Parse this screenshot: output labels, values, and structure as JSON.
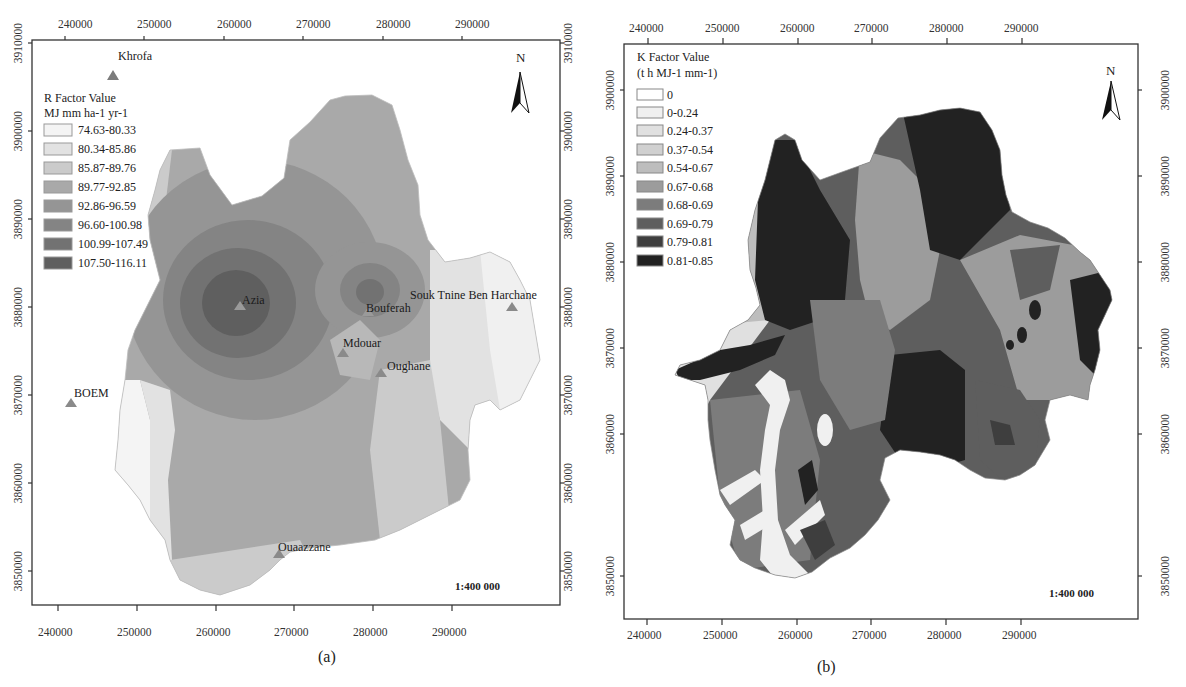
{
  "figure": {
    "panels": [
      {
        "id": "a",
        "caption": "(a)",
        "x_ticks": [
          "240000",
          "250000",
          "260000",
          "270000",
          "280000",
          "290000"
        ],
        "y_ticks": [
          "3910000",
          "3900000",
          "3890000",
          "3880000",
          "3870000",
          "3860000",
          "3850000"
        ],
        "legend": {
          "title_line1": "R Factor Value",
          "title_line2": "MJ mm ha-1 yr-1",
          "items": [
            {
              "label": "74.63-80.33",
              "color": "#f4f4f4"
            },
            {
              "label": "80.34-85.86",
              "color": "#e2e2e2"
            },
            {
              "label": "85.87-89.76",
              "color": "#cbcbcb"
            },
            {
              "label": "89.77-92.85",
              "color": "#a9a9a9"
            },
            {
              "label": "92.86-96.59",
              "color": "#959595"
            },
            {
              "label": "96.60-100.98",
              "color": "#848484"
            },
            {
              "label": "100.99-107.49",
              "color": "#727272"
            },
            {
              "label": "107.50-116.11",
              "color": "#5f5f5f"
            }
          ]
        },
        "stations": [
          {
            "name": "Khrofa"
          },
          {
            "name": "Azia"
          },
          {
            "name": "Bouferah"
          },
          {
            "name": "Souk Tnine Ben Harchane"
          },
          {
            "name": "Mdouar"
          },
          {
            "name": "Oughane"
          },
          {
            "name": "BOEM"
          },
          {
            "name": "Ouaazzane"
          }
        ],
        "north_label": "N",
        "scale": "1:400 000"
      },
      {
        "id": "b",
        "caption": "(b)",
        "x_ticks": [
          "240000",
          "250000",
          "260000",
          "270000",
          "280000",
          "290000"
        ],
        "y_ticks": [
          "3900000",
          "3890000",
          "3880000",
          "3870000",
          "3860000",
          "3850000"
        ],
        "legend": {
          "title_line1": "K Factor Value",
          "title_line2": "(t h MJ-1 mm-1)",
          "items": [
            {
              "label": "0",
              "color": "#ffffff"
            },
            {
              "label": "0-0.24",
              "color": "#f0f0f0"
            },
            {
              "label": "0.24-0.37",
              "color": "#e0e0e0"
            },
            {
              "label": "0.37-0.54",
              "color": "#d0d0d0"
            },
            {
              "label": "0.54-0.67",
              "color": "#bdbdbd"
            },
            {
              "label": "0.67-0.68",
              "color": "#9c9c9c"
            },
            {
              "label": "0.68-0.69",
              "color": "#7c7c7c"
            },
            {
              "label": "0.69-0.79",
              "color": "#5e5e5e"
            },
            {
              "label": "0.79-0.81",
              "color": "#3e3e3e"
            },
            {
              "label": "0.81-0.85",
              "color": "#222222"
            }
          ]
        },
        "north_label": "N",
        "scale": "1:400 000"
      }
    ]
  }
}
